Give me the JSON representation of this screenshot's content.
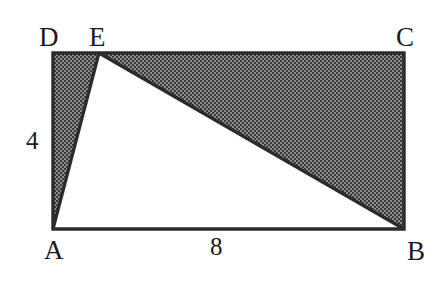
{
  "figure": {
    "kind": "geometry-diagram",
    "background_color": "#ffffff",
    "stroke_color": "#2b2b2b",
    "shade_dark_color": "#3a3a3a",
    "shade_light_color": "#8d8d8d",
    "unshaded_fill": "#ffffff"
  },
  "vertices": {
    "A": {
      "label": "A",
      "x": 53,
      "y": 229
    },
    "B": {
      "label": "B",
      "x": 404,
      "y": 229
    },
    "C": {
      "label": "C",
      "x": 404,
      "y": 53
    },
    "D": {
      "label": "D",
      "x": 53,
      "y": 53
    },
    "E": {
      "label": "E",
      "x": 99,
      "y": 53
    }
  },
  "measurements": {
    "height_side_AD": {
      "value": "4",
      "side": "AD",
      "position": "left"
    },
    "width_side_AB": {
      "value": "8",
      "side": "AB",
      "position": "bottom"
    }
  },
  "shaded_regions": [
    {
      "name": "triangle-ADE",
      "points": "53,229 53,53 99,53"
    },
    {
      "name": "triangle-EBC",
      "points": "99,53 404,53 404,229"
    }
  ],
  "unshaded_regions": [
    {
      "name": "triangle-AEB",
      "points": "53,229 99,53 404,229"
    }
  ],
  "outline": {
    "rectangle": "53,53 404,53 404,229 53,229",
    "segment_AE": "53,229 99,53",
    "segment_EB": "99,53 404,229"
  }
}
